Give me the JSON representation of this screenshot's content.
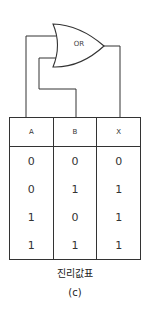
{
  "gate": {
    "label": "OR",
    "type": "OR"
  },
  "table": {
    "headers": [
      "A",
      "B",
      "X"
    ],
    "rows": [
      [
        "0",
        "0",
        "0"
      ],
      [
        "0",
        "1",
        "1"
      ],
      [
        "1",
        "0",
        "1"
      ],
      [
        "1",
        "1",
        "1"
      ]
    ]
  },
  "caption": "진리값표",
  "sublabel": "(c)",
  "colors": {
    "line": "#333333",
    "background": "#ffffff"
  }
}
